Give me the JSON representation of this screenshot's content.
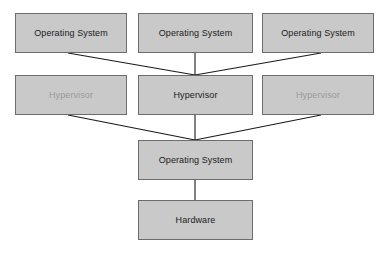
{
  "diagram": {
    "type": "block-diagram",
    "background_color": "#ffffff",
    "node_fill_color": "#c9c9c9",
    "node_border_color": "#6d6d6d",
    "text_color": "#1a1a1a",
    "muted_text_color": "#9a9a9a",
    "connector_color": "#1a1a1a",
    "rows": [
      {
        "name": "guest-operating-systems",
        "nodes": [
          {
            "id": "os-left",
            "label": "Operating System",
            "muted": false
          },
          {
            "id": "os-center",
            "label": "Operating System",
            "muted": false
          },
          {
            "id": "os-right",
            "label": "Operating System",
            "muted": false
          }
        ]
      },
      {
        "name": "hypervisors",
        "nodes": [
          {
            "id": "hv-left",
            "label": "Hypervisor",
            "muted": true
          },
          {
            "id": "hv-center",
            "label": "Hypervisor",
            "muted": false
          },
          {
            "id": "hv-right",
            "label": "Hypervisor",
            "muted": true
          }
        ]
      },
      {
        "name": "host-operating-system",
        "nodes": [
          {
            "id": "host-os",
            "label": "Operating System",
            "muted": false
          }
        ]
      },
      {
        "name": "hardware",
        "nodes": [
          {
            "id": "hardware",
            "label": "Hardware",
            "muted": false
          }
        ]
      }
    ],
    "connections": [
      {
        "from": "os-left",
        "to": "hv-center"
      },
      {
        "from": "os-center",
        "to": "hv-center"
      },
      {
        "from": "os-right",
        "to": "hv-center"
      },
      {
        "from": "hv-left",
        "to": "host-os"
      },
      {
        "from": "hv-center",
        "to": "host-os"
      },
      {
        "from": "hv-right",
        "to": "host-os"
      },
      {
        "from": "host-os",
        "to": "hardware"
      }
    ]
  },
  "labels": {
    "os_left": "Operating System",
    "os_center": "Operating System",
    "os_right": "Operating System",
    "hv_left": "Hypervisor",
    "hv_center": "Hypervisor",
    "hv_right": "Hypervisor",
    "host_os": "Operating System",
    "hardware": "Hardware"
  }
}
